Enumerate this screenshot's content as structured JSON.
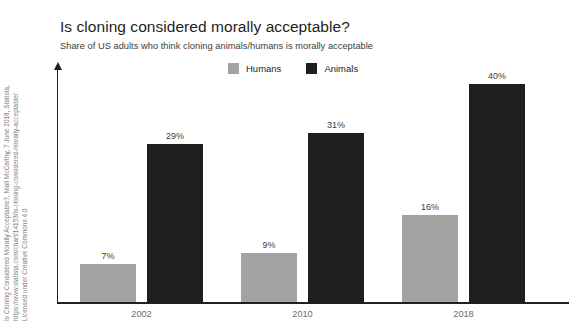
{
  "header": {
    "title": "Is cloning considered morally acceptable?",
    "subtitle": "Share of US adults who think cloning animals/humans is morally acceptable"
  },
  "legend": {
    "position": "top-center",
    "items": [
      {
        "label": "Humans",
        "color": "#a3a3a3",
        "swatch_name": "legend-swatch-humans"
      },
      {
        "label": "Animals",
        "color": "#1f1d1e",
        "swatch_name": "legend-swatch-animals"
      }
    ]
  },
  "source": {
    "lines": [
      "Is Cloning Considered Morally Acceptable?, Niall McCarthy, 7 June 2018, Statista,",
      "https://www.statista.com/chart/14153/is-cloning-considered-morally-acceptable/",
      "Licensed under Creative Commons 4.0",
      ""
    ]
  },
  "axis": {
    "x_tick_labels": [
      "2002",
      "2010",
      "2018"
    ],
    "y_arrow": true,
    "y_tick_labels": [],
    "grid": false
  },
  "chart_data": {
    "type": "bar",
    "title": "Is cloning considered morally acceptable?",
    "subtitle": "Share of US adults who think cloning animals/humans is morally acceptable",
    "categories": [
      "2002",
      "2010",
      "2018"
    ],
    "series": [
      {
        "name": "Humans",
        "color": "#a3a3a3",
        "values": [
          7,
          9,
          16
        ],
        "labels": [
          "7%",
          "9%",
          "16%"
        ]
      },
      {
        "name": "Animals",
        "color": "#1f1d1e",
        "values": [
          29,
          31,
          40
        ],
        "labels": [
          "29%",
          "31%",
          "40%"
        ]
      }
    ],
    "xlabel": "",
    "ylabel": "",
    "unit": "%",
    "ylim": [
      0,
      44
    ],
    "legend_position": "top-center",
    "grid": false
  }
}
